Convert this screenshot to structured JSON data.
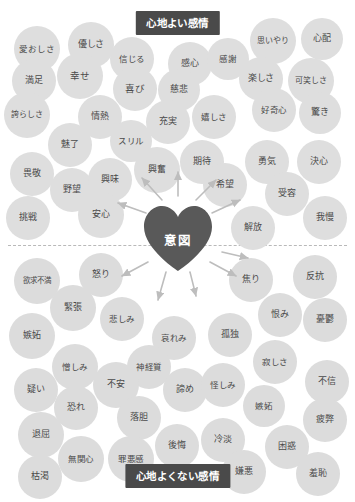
{
  "diagram": {
    "center_label": "意図",
    "top_band_label": "心地よい感情",
    "bottom_band_label": "心地よくない感情",
    "accent_color": "#4a4a4a",
    "bubble_color": "#dcdcdc",
    "background_color": "#ffffff"
  },
  "pleasant_emotions": [
    {
      "label": "愛おしさ",
      "x": 14,
      "y": 26,
      "d": 46,
      "fs": 8.5
    },
    {
      "label": "優しさ",
      "x": 68,
      "y": 22,
      "d": 46,
      "fs": 9
    },
    {
      "label": "信じる",
      "x": 110,
      "y": 37,
      "d": 44,
      "fs": 8.5
    },
    {
      "label": "感心",
      "x": 168,
      "y": 42,
      "d": 44,
      "fs": 9
    },
    {
      "label": "感謝",
      "x": 207,
      "y": 38,
      "d": 42,
      "fs": 8.5
    },
    {
      "label": "思いやり",
      "x": 250,
      "y": 18,
      "d": 46,
      "fs": 8
    },
    {
      "label": "心配",
      "x": 301,
      "y": 18,
      "d": 42,
      "fs": 9
    },
    {
      "label": "満足",
      "x": 12,
      "y": 59,
      "d": 44,
      "fs": 9
    },
    {
      "label": "幸せ",
      "x": 57,
      "y": 53,
      "d": 46,
      "fs": 9.5
    },
    {
      "label": "喜び",
      "x": 113,
      "y": 67,
      "d": 44,
      "fs": 9.5
    },
    {
      "label": "慈悲",
      "x": 158,
      "y": 69,
      "d": 42,
      "fs": 9
    },
    {
      "label": "楽しさ",
      "x": 239,
      "y": 57,
      "d": 44,
      "fs": 9
    },
    {
      "label": "可笑しさ",
      "x": 288,
      "y": 58,
      "d": 46,
      "fs": 8
    },
    {
      "label": "誇らしさ",
      "x": 4,
      "y": 92,
      "d": 46,
      "fs": 8
    },
    {
      "label": "情熱",
      "x": 78,
      "y": 95,
      "d": 44,
      "fs": 9
    },
    {
      "label": "充実",
      "x": 146,
      "y": 100,
      "d": 44,
      "fs": 9
    },
    {
      "label": "スリル",
      "x": 110,
      "y": 120,
      "d": 42,
      "fs": 8.5
    },
    {
      "label": "嬉しさ",
      "x": 192,
      "y": 95,
      "d": 44,
      "fs": 8.5
    },
    {
      "label": "好奇心",
      "x": 252,
      "y": 88,
      "d": 44,
      "fs": 8.5
    },
    {
      "label": "驚き",
      "x": 299,
      "y": 92,
      "d": 42,
      "fs": 9
    },
    {
      "label": "魅了",
      "x": 48,
      "y": 123,
      "d": 44,
      "fs": 9
    },
    {
      "label": "畏敬",
      "x": 10,
      "y": 152,
      "d": 44,
      "fs": 9
    },
    {
      "label": "興奮",
      "x": 134,
      "y": 147,
      "d": 46,
      "fs": 9
    },
    {
      "label": "期待",
      "x": 180,
      "y": 140,
      "d": 44,
      "fs": 9
    },
    {
      "label": "勇気",
      "x": 245,
      "y": 140,
      "d": 44,
      "fs": 9
    },
    {
      "label": "決心",
      "x": 297,
      "y": 140,
      "d": 44,
      "fs": 9
    },
    {
      "label": "野望",
      "x": 50,
      "y": 168,
      "d": 44,
      "fs": 9
    },
    {
      "label": "興味",
      "x": 88,
      "y": 158,
      "d": 44,
      "fs": 9
    },
    {
      "label": "希望",
      "x": 203,
      "y": 163,
      "d": 44,
      "fs": 9
    },
    {
      "label": "受容",
      "x": 265,
      "y": 172,
      "d": 44,
      "fs": 9
    },
    {
      "label": "挑戦",
      "x": 6,
      "y": 196,
      "d": 44,
      "fs": 9
    },
    {
      "label": "安心",
      "x": 78,
      "y": 192,
      "d": 46,
      "fs": 9
    },
    {
      "label": "解放",
      "x": 231,
      "y": 206,
      "d": 44,
      "fs": 9
    },
    {
      "label": "我慢",
      "x": 303,
      "y": 196,
      "d": 44,
      "fs": 9
    }
  ],
  "unpleasant_emotions": [
    {
      "label": "欲求不満",
      "x": 14,
      "y": 258,
      "d": 46,
      "fs": 7.5
    },
    {
      "label": "怒り",
      "x": 79,
      "y": 253,
      "d": 44,
      "fs": 9
    },
    {
      "label": "焦り",
      "x": 229,
      "y": 258,
      "d": 44,
      "fs": 9
    },
    {
      "label": "反抗",
      "x": 293,
      "y": 255,
      "d": 44,
      "fs": 9
    },
    {
      "label": "緊張",
      "x": 50,
      "y": 285,
      "d": 46,
      "fs": 9
    },
    {
      "label": "悲しみ",
      "x": 100,
      "y": 297,
      "d": 44,
      "fs": 8.5
    },
    {
      "label": "恨み",
      "x": 258,
      "y": 293,
      "d": 44,
      "fs": 9
    },
    {
      "label": "憂鬱",
      "x": 303,
      "y": 298,
      "d": 44,
      "fs": 9
    },
    {
      "label": "嫉妬",
      "x": 9,
      "y": 313,
      "d": 46,
      "fs": 9
    },
    {
      "label": "哀れみ",
      "x": 152,
      "y": 316,
      "d": 44,
      "fs": 8.5
    },
    {
      "label": "孤独",
      "x": 208,
      "y": 313,
      "d": 44,
      "fs": 9
    },
    {
      "label": "憎しみ",
      "x": 52,
      "y": 344,
      "d": 46,
      "fs": 8.5
    },
    {
      "label": "神経質",
      "x": 127,
      "y": 345,
      "d": 44,
      "fs": 8.5
    },
    {
      "label": "寂しさ",
      "x": 253,
      "y": 340,
      "d": 44,
      "fs": 8.5
    },
    {
      "label": "疑い",
      "x": 14,
      "y": 368,
      "d": 44,
      "fs": 9
    },
    {
      "label": "不安",
      "x": 93,
      "y": 362,
      "d": 46,
      "fs": 9
    },
    {
      "label": "諦め",
      "x": 163,
      "y": 368,
      "d": 44,
      "fs": 9
    },
    {
      "label": "怪しみ",
      "x": 201,
      "y": 363,
      "d": 44,
      "fs": 8.5
    },
    {
      "label": "不信",
      "x": 305,
      "y": 360,
      "d": 44,
      "fs": 9
    },
    {
      "label": "恐れ",
      "x": 54,
      "y": 386,
      "d": 44,
      "fs": 9
    },
    {
      "label": "落胆",
      "x": 117,
      "y": 396,
      "d": 44,
      "fs": 9
    },
    {
      "label": "嫉妬",
      "x": 243,
      "y": 385,
      "d": 42,
      "fs": 8.5
    },
    {
      "label": "疲弊",
      "x": 303,
      "y": 398,
      "d": 44,
      "fs": 9
    },
    {
      "label": "退屈",
      "x": 18,
      "y": 412,
      "d": 46,
      "fs": 9
    },
    {
      "label": "後悔",
      "x": 155,
      "y": 424,
      "d": 44,
      "fs": 9
    },
    {
      "label": "冷淡",
      "x": 201,
      "y": 418,
      "d": 44,
      "fs": 9
    },
    {
      "label": "困惑",
      "x": 265,
      "y": 425,
      "d": 44,
      "fs": 9
    },
    {
      "label": "無関心",
      "x": 58,
      "y": 436,
      "d": 46,
      "fs": 8.5
    },
    {
      "label": "罪悪感",
      "x": 108,
      "y": 436,
      "d": 46,
      "fs": 8.5
    },
    {
      "label": "枯渇",
      "x": 18,
      "y": 455,
      "d": 44,
      "fs": 9
    },
    {
      "label": "嫌悪",
      "x": 222,
      "y": 450,
      "d": 44,
      "fs": 9
    },
    {
      "label": "羞恥",
      "x": 296,
      "y": 452,
      "d": 44,
      "fs": 9
    }
  ],
  "arrows": [
    {
      "x1": 162,
      "y1": 200,
      "x2": 142,
      "y2": 178
    },
    {
      "x1": 178,
      "y1": 196,
      "x2": 178,
      "y2": 172
    },
    {
      "x1": 196,
      "y1": 200,
      "x2": 216,
      "y2": 180
    },
    {
      "x1": 146,
      "y1": 213,
      "x2": 118,
      "y2": 203
    },
    {
      "x1": 212,
      "y1": 213,
      "x2": 240,
      "y2": 200
    },
    {
      "x1": 148,
      "y1": 262,
      "x2": 122,
      "y2": 276
    },
    {
      "x1": 166,
      "y1": 272,
      "x2": 158,
      "y2": 300
    },
    {
      "x1": 190,
      "y1": 272,
      "x2": 196,
      "y2": 296
    },
    {
      "x1": 210,
      "y1": 262,
      "x2": 236,
      "y2": 276
    },
    {
      "x1": 222,
      "y1": 252,
      "x2": 248,
      "y2": 258
    }
  ]
}
